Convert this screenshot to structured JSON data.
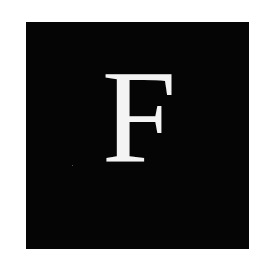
{
  "logo": {
    "letter": "F",
    "background_color": "#050505",
    "letter_color": "#f4f4f4"
  }
}
